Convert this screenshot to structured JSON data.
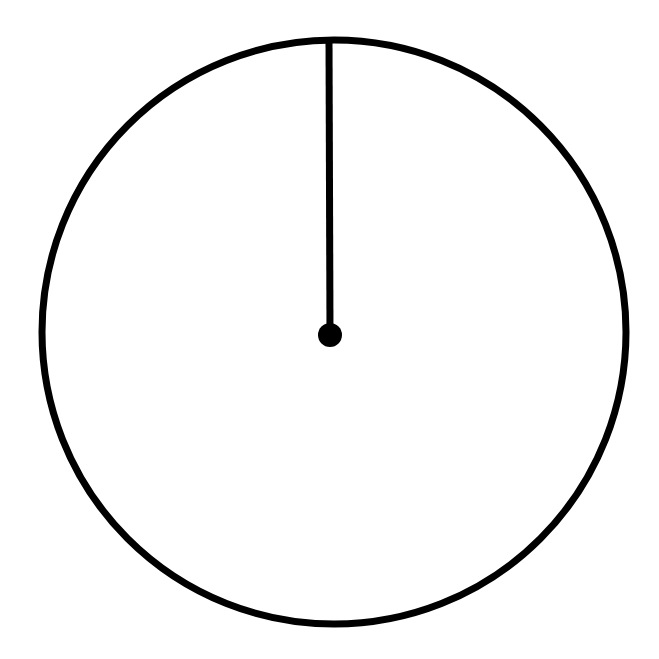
{
  "figure": {
    "background_color": "#ffffff",
    "stroke_color": "#000000",
    "canvas": {
      "width": 659,
      "height": 659
    },
    "shapes": {
      "circle": {
        "name": "circle-outline",
        "center_x": 334,
        "center_y": 332,
        "radius": 292,
        "stroke_width": 7,
        "fill": "none",
        "stroke_color": "#000000"
      },
      "radius_line": {
        "name": "radius-segment",
        "x1": 329,
        "y1": 38,
        "x2": 330,
        "y2": 335,
        "stroke_width": 7,
        "stroke_color": "#000000",
        "orientation": "vertical",
        "direction": "from top of circle to center"
      },
      "center_dot": {
        "name": "center-point",
        "center_x": 330,
        "center_y": 335,
        "radius": 12,
        "fill": "#000000"
      }
    },
    "labels": [],
    "annotations": []
  }
}
